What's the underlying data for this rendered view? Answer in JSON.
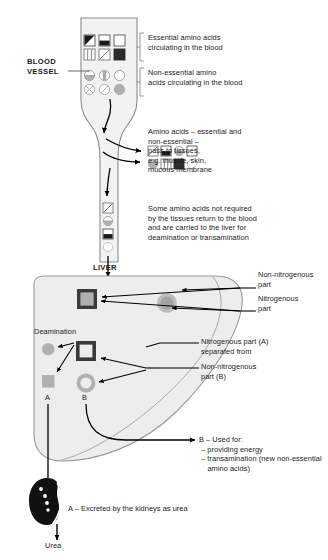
{
  "diagram": {
    "title_labels": {
      "blood_vessel": "BLOOD\nVESSEL",
      "liver": "LIVER",
      "deamination": "Deamination",
      "label_a": "A",
      "label_b": "B",
      "urea": "Urea"
    },
    "annotations": {
      "essential": "Essential amino acids\ncirculating in the blood",
      "non_essential": "Non-essential amino\nacids circulating in the blood",
      "pass_to_tissues": "Amino acids – essential and\nnon-essential –\npass to tissues,\ne.g. muscle, skin,\nmucous membrane",
      "return_to_blood": "Some amino acids not required\nby the tissues return to the blood\nand are carried to the liver for\ndeamination or transamination",
      "non_nitrogenous_part": "Non-nitrogenous\npart",
      "nitrogenous_part": "Nitrogenous\npart",
      "nitrogenous_a": "Nitrogenous part (A)\nseparated from",
      "non_nitrogenous_b": "Non-nitrogenous\npart (B)",
      "b_used_for": "B – Used for:\n – providing energy\n – transamination (new non-essential\n    amino acids)",
      "a_excreted": "A – Excreted by the kidneys as urea"
    },
    "symbol_groups": {
      "essential_blood": [
        {
          "shape": "square",
          "fill": "diagonal-triangle"
        },
        {
          "shape": "square",
          "fill": "bottom-half"
        },
        {
          "shape": "square",
          "fill": "empty"
        },
        {
          "shape": "square",
          "fill": "vertical-split"
        },
        {
          "shape": "square",
          "fill": "diagonal-line"
        },
        {
          "shape": "square",
          "fill": "solid-black"
        }
      ],
      "non_essential_blood": [
        {
          "shape": "circle",
          "fill": "bottom-half"
        },
        {
          "shape": "circle",
          "fill": "vertical-bar"
        },
        {
          "shape": "circle",
          "fill": "empty"
        },
        {
          "shape": "circle",
          "fill": "cross"
        },
        {
          "shape": "circle",
          "fill": "diagonal-line"
        },
        {
          "shape": "circle",
          "fill": "solid-gray"
        }
      ],
      "pass_to_tissues": [
        {
          "shape": "square",
          "fill": "diagonal-line"
        },
        {
          "shape": "square",
          "fill": "bottom-half"
        },
        {
          "shape": "circle",
          "fill": "bottom-half"
        },
        {
          "shape": "square",
          "fill": "empty"
        },
        {
          "shape": "circle",
          "fill": "solid-gray"
        },
        {
          "shape": "square",
          "fill": "vertical-split"
        },
        {
          "shape": "square",
          "fill": "solid-black"
        },
        {
          "shape": "circle",
          "fill": "empty"
        }
      ],
      "returning_to_liver": [
        {
          "shape": "square",
          "fill": "diagonal-line"
        },
        {
          "shape": "circle",
          "fill": "bottom-half"
        },
        {
          "shape": "square",
          "fill": "bottom-half"
        },
        {
          "shape": "circle",
          "fill": "empty"
        }
      ],
      "liver_upper": [
        {
          "shape": "square",
          "fill": "outlined-gray",
          "name": "nitrogenous-and-non-nitrogenous-square"
        },
        {
          "shape": "circle",
          "fill": "ringed-gray",
          "name": "nitrogenous-and-non-nitrogenous-circle"
        }
      ],
      "liver_lower": [
        {
          "shape": "circle",
          "fill": "solid-gray",
          "name": "nitrogenous-part-a-circle"
        },
        {
          "shape": "square",
          "fill": "solid-gray",
          "name": "nitrogenous-part-a-square"
        },
        {
          "shape": "square",
          "fill": "thick-outline",
          "name": "separated-square"
        },
        {
          "shape": "circle",
          "fill": "thick-ring",
          "name": "non-nitrogenous-part-b-ring"
        }
      ]
    },
    "colors": {
      "vessel_fill": "#f2f2f2",
      "vessel_stroke": "#8c8c8c",
      "liver_fill": "#ededed",
      "liver_stroke": "#999999",
      "symbol_gray": "#b3b3b3",
      "symbol_dark": "#3a3a3a",
      "black": "#000000",
      "kidney": "#111111",
      "text": "#1c1c1c"
    }
  }
}
